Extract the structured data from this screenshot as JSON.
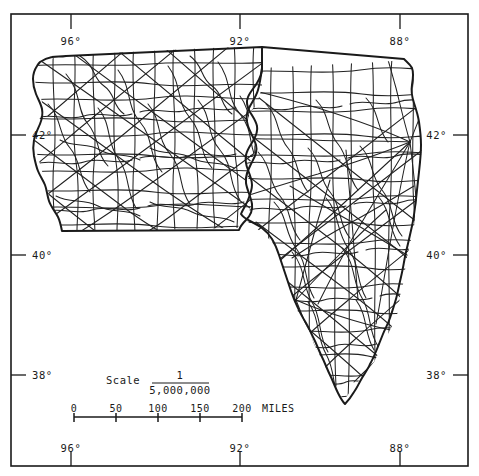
{
  "figure": {
    "kind": "reference-map",
    "background_color": "#ffffff",
    "ink_color": "#1a1a1a",
    "width": 479,
    "height": 476
  },
  "neatline": {
    "name": "map-frame",
    "stroke": "#1a1a1a",
    "stroke_width": 1.6,
    "x": 11,
    "y": 14,
    "width": 457,
    "height": 452
  },
  "graticule": {
    "longitude": {
      "axis_label": "",
      "unit": "°",
      "top_labels": [
        "96°",
        "92°",
        "88°"
      ],
      "bottom_labels": [
        "96°",
        "92°",
        "88°"
      ],
      "values": [
        96,
        92,
        88
      ],
      "tick_x": [
        71,
        240,
        400
      ]
    },
    "latitude": {
      "axis_label": "",
      "unit": "°",
      "left_labels": [
        "42°",
        "40°",
        "38°"
      ],
      "right_labels": [
        "42°",
        "40°",
        "38°"
      ],
      "values": [
        42,
        40,
        38
      ],
      "tick_y": [
        135,
        255,
        375
      ]
    }
  },
  "scale_bar": {
    "name": "scale-bar",
    "title_word": "Scale",
    "ratio_numerator": "1",
    "ratio_denominator": "5,000,000",
    "units_label": "MILES",
    "tick_labels": [
      "0",
      "50",
      "100",
      "150",
      "200"
    ],
    "tick_values": [
      0,
      50,
      100,
      150,
      200
    ],
    "bar_x_start": 74,
    "bar_x_end": 242,
    "bar_y": 417
  },
  "layers": [
    {
      "name": "state-outline",
      "label": "State boundaries",
      "stroke": "#1a1a1a",
      "stroke_width": 2.0,
      "fill": "none"
    },
    {
      "name": "highway-network",
      "label": "Highways",
      "stroke": "#222222",
      "stroke_width": 1.1,
      "fill": "none"
    }
  ]
}
